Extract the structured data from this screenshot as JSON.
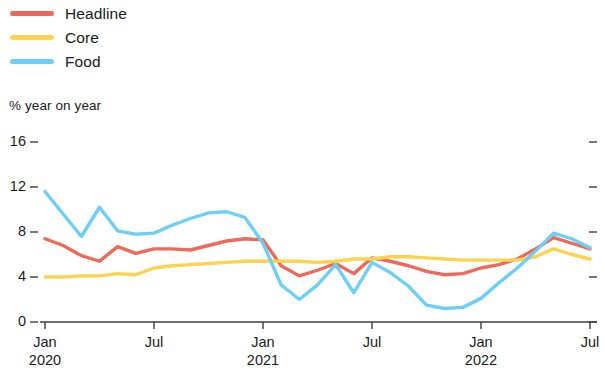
{
  "legend": {
    "position": "top-left",
    "items": [
      {
        "label": "Headline",
        "color": "#ED6A5A",
        "icon": "line-swatch-icon"
      },
      {
        "label": "Core",
        "color": "#FBD34D",
        "icon": "line-swatch-icon"
      },
      {
        "label": "Food",
        "color": "#6DCFF6",
        "icon": "line-swatch-icon"
      }
    ]
  },
  "axis": {
    "y_title": "% year on year",
    "y_ticks": [
      "0",
      "4",
      "8",
      "12",
      "16"
    ],
    "x_ticks": [
      {
        "month": "Jan",
        "year": "2020"
      },
      {
        "month": "Jul",
        "year": ""
      },
      {
        "month": "Jan",
        "year": "2021"
      },
      {
        "month": "Jul",
        "year": ""
      },
      {
        "month": "Jan",
        "year": "2022"
      },
      {
        "month": "Jul",
        "year": ""
      }
    ]
  },
  "chart_data": {
    "type": "line",
    "title": "",
    "subtitle": "",
    "xlabel": "",
    "ylabel": "% year on year",
    "ylim": [
      0,
      16
    ],
    "yticks": [
      0,
      4,
      8,
      12,
      16
    ],
    "grid": false,
    "legend_position": "top-left",
    "x": [
      "Jan 2020",
      "Feb 2020",
      "Mar 2020",
      "Apr 2020",
      "May 2020",
      "Jun 2020",
      "Jul 2020",
      "Aug 2020",
      "Sep 2020",
      "Oct 2020",
      "Nov 2020",
      "Dec 2020",
      "Jan 2021",
      "Feb 2021",
      "Mar 2021",
      "Apr 2021",
      "May 2021",
      "Jun 2021",
      "Jul 2021",
      "Aug 2021",
      "Sep 2021",
      "Oct 2021",
      "Nov 2021",
      "Dec 2021",
      "Jan 2022",
      "Feb 2022",
      "Mar 2022",
      "Apr 2022",
      "May 2022",
      "Jun 2022",
      "Jul 2022"
    ],
    "xtick_labels": [
      "Jan 2020",
      "Jul",
      "Jan 2021",
      "Jul",
      "Jan 2022",
      "Jul"
    ],
    "xtick_indices": [
      0,
      6,
      12,
      18,
      24,
      30
    ],
    "series": [
      {
        "name": "Headline",
        "color": "#ED6A5A",
        "values": [
          7.4,
          6.8,
          5.9,
          5.4,
          6.7,
          6.1,
          6.5,
          6.5,
          6.4,
          6.8,
          7.2,
          7.4,
          7.3,
          5.0,
          4.1,
          4.6,
          5.2,
          4.3,
          5.7,
          5.4,
          5.0,
          4.5,
          4.2,
          4.3,
          4.8,
          5.1,
          5.6,
          6.5,
          7.5,
          7.0,
          6.5
        ]
      },
      {
        "name": "Core",
        "color": "#FBD34D",
        "values": [
          4.0,
          4.0,
          4.1,
          4.1,
          4.3,
          4.2,
          4.8,
          5.0,
          5.1,
          5.2,
          5.3,
          5.4,
          5.4,
          5.4,
          5.4,
          5.3,
          5.4,
          5.6,
          5.6,
          5.8,
          5.8,
          5.7,
          5.6,
          5.5,
          5.5,
          5.5,
          5.5,
          5.8,
          6.5,
          6.0,
          5.6
        ]
      },
      {
        "name": "Food",
        "color": "#6DCFF6",
        "values": [
          11.6,
          9.6,
          7.6,
          10.2,
          8.1,
          7.8,
          7.9,
          8.6,
          9.2,
          9.7,
          9.8,
          9.3,
          7.0,
          3.3,
          2.0,
          3.3,
          5.1,
          2.6,
          5.3,
          4.4,
          3.2,
          1.5,
          1.2,
          1.3,
          2.1,
          3.5,
          4.8,
          6.3,
          7.9,
          7.4,
          6.6
        ]
      }
    ]
  }
}
